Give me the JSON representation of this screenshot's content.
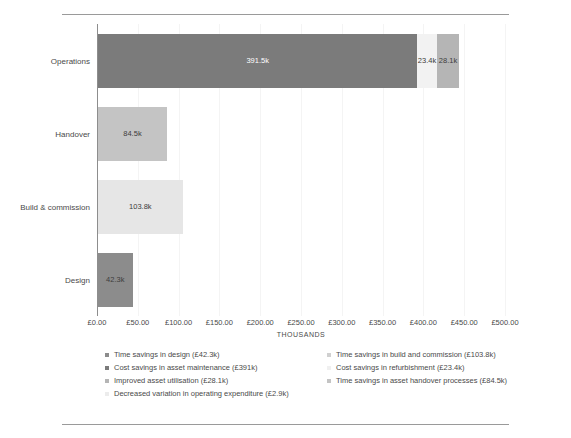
{
  "document": {
    "top_rule": "",
    "bottom_rule": ""
  },
  "chart_data": {
    "type": "bar",
    "orientation": "horizontal",
    "stacked": true,
    "title": "",
    "xlabel": "THOUSANDS",
    "ylabel": "",
    "xlim": [
      0,
      500
    ],
    "grid": true,
    "legend_position": "bottom",
    "categories": [
      "Operations",
      "Handover",
      "Build & commission",
      "Design"
    ],
    "xticks": [
      "£0.00",
      "£50.00",
      "£100.00",
      "£150.00",
      "£200.00",
      "£250.00",
      "£300.00",
      "£350.00",
      "£400.00",
      "£450.00",
      "£500.00"
    ],
    "xtick_values": [
      0,
      50,
      100,
      150,
      200,
      250,
      300,
      350,
      400,
      450,
      500
    ],
    "series": [
      {
        "name": "Time savings in design (£42.3k)",
        "short": "Time savings in design",
        "amount": "£42.3k",
        "color": "#8c8c8c",
        "values": [
          0,
          0,
          0,
          42.3
        ]
      },
      {
        "name": "Time savings in build and commission (£103.8k)",
        "short": "Time savings in build and commission",
        "amount": "£103.8k",
        "color": "#e6e6e6",
        "values": [
          0,
          0,
          103.8,
          0
        ]
      },
      {
        "name": "Cost savings in asset maintenance (£391k)",
        "short": "Cost savings in asset maintenance",
        "amount": "£391k",
        "color": "#7b7b7b",
        "values": [
          391.5,
          0,
          0,
          0
        ]
      },
      {
        "name": "Cost savings in refurbishment (£23.4k)",
        "short": "Cost savings in refurbishment",
        "amount": "£23.4k",
        "color": "#f2f2f2",
        "values": [
          23.4,
          0,
          0,
          0
        ]
      },
      {
        "name": "Improved asset utilisation (£28.1k)",
        "short": "Improved asset utilisation",
        "amount": "£28.1k",
        "color": "#b5b5b5",
        "values": [
          28.1,
          0,
          0,
          0
        ]
      },
      {
        "name": "Time savings in asset handover processes (£84.5k)",
        "short": "Time savings in asset handover processes",
        "amount": "£84.5k",
        "color": "#c4c4c4",
        "values": [
          0,
          84.5,
          0,
          0
        ]
      },
      {
        "name": "Decreased variation in operating expenditure (£2.9k)",
        "short": "Decreased variation in operating expenditure",
        "amount": "£2.9k",
        "color": "#fafafa",
        "values": [
          2.9,
          0,
          0,
          0
        ]
      }
    ],
    "bars": [
      {
        "category": "Operations",
        "total": 443.0,
        "segments": [
          {
            "label": "391.5k",
            "value": 391.5,
            "color": "#7b7b7b",
            "text": "light",
            "series": "Cost savings in asset maintenance (£391k)"
          },
          {
            "label": "23.4k",
            "value": 23.4,
            "color": "#f2f2f2",
            "text": "dark",
            "series": "Cost savings in refurbishment (£23.4k)"
          },
          {
            "label": "28.1k",
            "value": 28.1,
            "color": "#b5b5b5",
            "text": "dark",
            "series": "Improved asset utilisation (£28.1k)"
          }
        ]
      },
      {
        "category": "Handover",
        "total": 84.5,
        "segments": [
          {
            "label": "84.5k",
            "value": 84.5,
            "color": "#c4c4c4",
            "text": "dark",
            "series": "Time savings in asset handover processes (£84.5k)"
          }
        ]
      },
      {
        "category": "Build & commission",
        "total": 103.8,
        "segments": [
          {
            "label": "103.8k",
            "value": 103.8,
            "color": "#e6e6e6",
            "text": "dark",
            "series": "Time savings in build and commission (£103.8k)"
          }
        ]
      },
      {
        "category": "Design",
        "total": 42.3,
        "segments": [
          {
            "label": "42.3k",
            "value": 42.3,
            "color": "#8c8c8c",
            "text": "dark",
            "series": "Time savings in design (£42.3k)"
          }
        ]
      }
    ],
    "legend": [
      {
        "label": "Time savings in design (£42.3k)",
        "color": "#8c8c8c",
        "column": "left"
      },
      {
        "label": "Time savings in build and commission (£103.8k)",
        "color": "#d0d0d0",
        "column": "right"
      },
      {
        "label": "Cost savings in asset maintenance (£391k)",
        "color": "#7b7b7b",
        "column": "left"
      },
      {
        "label": "Cost savings in refurbishment (£23.4k)",
        "color": "#f0f0f0",
        "column": "right"
      },
      {
        "label": "Improved asset utilisation (£28.1k)",
        "color": "#b5b5b5",
        "column": "left"
      },
      {
        "label": "Time savings in asset handover processes (£84.5k)",
        "color": "#c4c4c4",
        "column": "right"
      },
      {
        "label": "Decreased variation in operating expenditure (£2.9k)",
        "color": "#ececec",
        "column": "wide"
      }
    ]
  }
}
